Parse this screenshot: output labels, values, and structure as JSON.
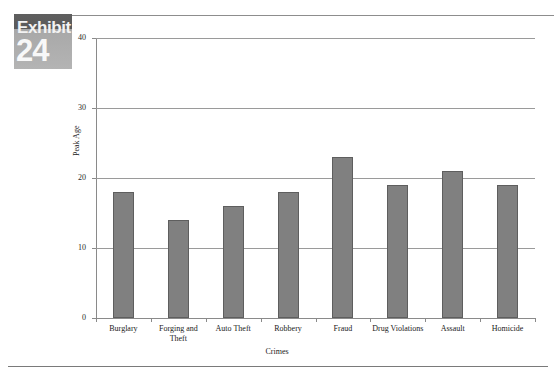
{
  "exhibit": {
    "word": "Exhibit",
    "number": "24"
  },
  "chart_data": {
    "type": "bar",
    "title": "",
    "xlabel": "Crimes",
    "ylabel": "Peak Age",
    "categories": [
      "Burglary",
      "Forging and Theft",
      "Auto Theft",
      "Robbery",
      "Fraud",
      "Drug Violations",
      "Assault",
      "Homicide"
    ],
    "values": [
      18,
      14,
      16,
      18,
      23,
      19,
      21,
      19
    ],
    "ylim": [
      0,
      40
    ],
    "yticks": [
      "0",
      "10",
      "20",
      "30",
      "40"
    ],
    "ytick_values": [
      0,
      10,
      20,
      30,
      40
    ],
    "grid": true,
    "legend": false,
    "bar_color": "#808080",
    "bar_border_color": "#5e5e5e",
    "gridline_color": "#9a9a9a",
    "axis_color": "#8a8a8a"
  }
}
